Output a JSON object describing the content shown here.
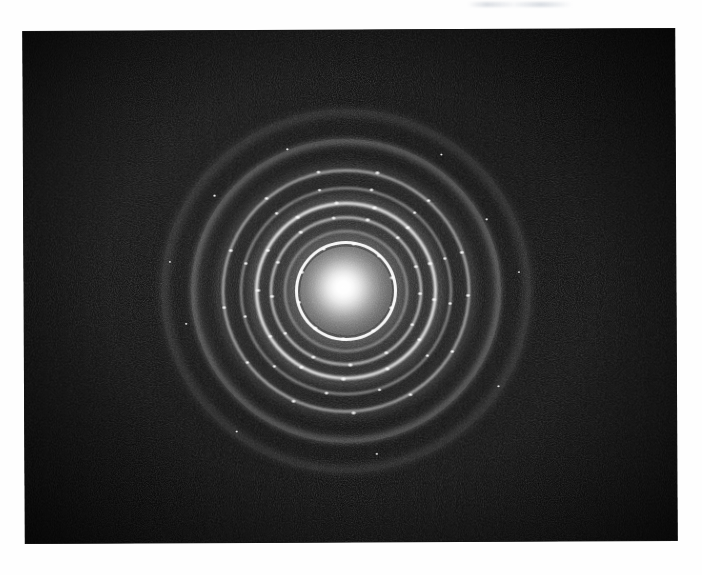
{
  "figure": {
    "kind": "electron-diffraction-pattern",
    "background_color": "#ffffff",
    "plate_color": "#050505",
    "ring_color": "#ffffff",
    "caption": "",
    "title": "",
    "labels": []
  },
  "plate": {
    "left": 24,
    "top": 30,
    "width": 652,
    "height": 512,
    "rotation_deg": -0.28
  },
  "chart_data": {
    "type": "scatter",
    "title": "",
    "xlabel": "",
    "ylabel": "",
    "subtitle": "",
    "legend": [],
    "grid": false,
    "center": {
      "x": 346,
      "y": 291
    },
    "rings": [
      {
        "index": 1,
        "radius_px": 48,
        "intensity": 0.95,
        "width_px": 3.0,
        "note": "innermost bright ring, strongly spotty"
      },
      {
        "index": 2,
        "radius_px": 60,
        "intensity": 0.48,
        "width_px": 2.0,
        "note": "weak ring just outside innermost"
      },
      {
        "index": 3,
        "radius_px": 74,
        "intensity": 0.88,
        "width_px": 2.6,
        "note": "bright ring"
      },
      {
        "index": 4,
        "radius_px": 88,
        "intensity": 0.92,
        "width_px": 3.0,
        "note": "bright ring, most spotty"
      },
      {
        "index": 5,
        "radius_px": 104,
        "intensity": 0.55,
        "width_px": 2.2,
        "note": "medium ring"
      },
      {
        "index": 6,
        "radius_px": 122,
        "intensity": 0.72,
        "width_px": 2.8,
        "note": "bright outer ring"
      },
      {
        "index": 7,
        "radius_px": 150,
        "intensity": 0.22,
        "width_px": 6.0,
        "note": "faint diffuse halo"
      },
      {
        "index": 8,
        "radius_px": 178,
        "intensity": 0.1,
        "width_px": 8.0,
        "note": "very faint outermost halo"
      }
    ],
    "central_beam": {
      "radius_px": 46,
      "peak_intensity": 1.0,
      "note": "saturated transmitted (000) beam with diffuse fall-off"
    }
  },
  "annotations": {
    "scan_artifact": "faint light smudge across the upper white margin"
  }
}
